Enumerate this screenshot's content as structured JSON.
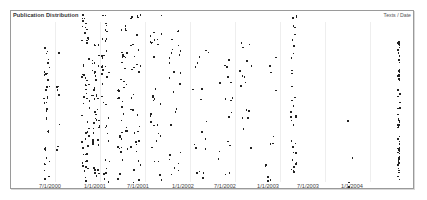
{
  "panel": {
    "title": "Publication Distribution",
    "subtitle": "Texts / Date"
  },
  "chart_data": {
    "type": "scatter",
    "title": "Publication Distribution",
    "subtitle": "Texts / Date",
    "xlabel": "Date",
    "ylabel": "Texts",
    "grid": true,
    "legend": "none",
    "x_ticks": [
      "7/1/2000",
      "1/1/2001",
      "7/1/2001",
      "1/1/2002",
      "7/1/2002",
      "1/1/2003",
      "7/1/2003",
      "1/1/2004"
    ],
    "x_tick_positions_px": [
      50,
      95,
      138,
      183,
      225,
      268,
      308,
      352
    ],
    "gridline_positions_px": [
      55,
      100,
      145,
      190,
      235,
      280,
      325,
      370
    ],
    "dot_color": "#222222",
    "clusters": [
      {
        "x_px": 46,
        "spread": 3,
        "count": 40,
        "y_range": [
          40,
          180
        ]
      },
      {
        "x_px": 58,
        "spread": 2,
        "count": 8,
        "y_range": [
          50,
          150
        ]
      },
      {
        "x_px": 85,
        "spread": 4,
        "count": 55,
        "y_range": [
          14,
          182
        ]
      },
      {
        "x_px": 95,
        "spread": 4,
        "count": 45,
        "y_range": [
          40,
          180
        ]
      },
      {
        "x_px": 105,
        "spread": 4,
        "count": 40,
        "y_range": [
          14,
          182
        ]
      },
      {
        "x_px": 122,
        "spread": 5,
        "count": 40,
        "y_range": [
          14,
          182
        ]
      },
      {
        "x_px": 135,
        "spread": 5,
        "count": 35,
        "y_range": [
          14,
          182
        ]
      },
      {
        "x_px": 155,
        "spread": 6,
        "count": 30,
        "y_range": [
          14,
          182
        ]
      },
      {
        "x_px": 175,
        "spread": 8,
        "count": 25,
        "y_range": [
          30,
          182
        ]
      },
      {
        "x_px": 200,
        "spread": 8,
        "count": 18,
        "y_range": [
          40,
          182
        ]
      },
      {
        "x_px": 225,
        "spread": 8,
        "count": 18,
        "y_range": [
          40,
          182
        ]
      },
      {
        "x_px": 245,
        "spread": 6,
        "count": 16,
        "y_range": [
          40,
          182
        ]
      },
      {
        "x_px": 270,
        "spread": 6,
        "count": 12,
        "y_range": [
          40,
          182
        ]
      },
      {
        "x_px": 293,
        "spread": 3,
        "count": 35,
        "y_range": [
          14,
          182
        ]
      },
      {
        "x_px": 350,
        "spread": 3,
        "count": 4,
        "y_range": [
          100,
          190
        ]
      },
      {
        "x_px": 398,
        "spread": 1,
        "count": 60,
        "y_range": [
          40,
          185
        ]
      }
    ]
  }
}
